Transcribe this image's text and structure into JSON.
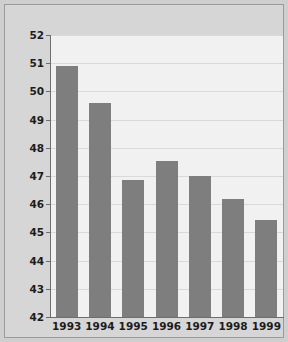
{
  "chart_data": {
    "type": "bar",
    "title": "",
    "xlabel": "",
    "ylabel": "% EU budget",
    "categories": [
      "1993",
      "1994",
      "1995",
      "1996",
      "1997",
      "1998",
      "1999"
    ],
    "values": [
      50.9,
      49.6,
      46.85,
      47.55,
      47.0,
      46.2,
      45.45
    ],
    "ylim": [
      42,
      52
    ],
    "yticks": [
      42,
      43,
      44,
      45,
      46,
      47,
      48,
      49,
      50,
      51,
      52
    ],
    "ytick_labels": [
      "42",
      "43",
      "44",
      "45",
      "46",
      "47",
      "48",
      "49",
      "50",
      "51",
      "52"
    ],
    "grid": true,
    "legend": false,
    "series": [
      {
        "name": "% EU budget",
        "values": [
          50.9,
          49.6,
          46.85,
          47.55,
          47.0,
          46.2,
          45.45
        ]
      }
    ],
    "colors": {
      "bar": "#7e7e7e",
      "plot_background": "#f1f1f1",
      "gridline": "#d9d9d9",
      "axis": "#6d6d6d",
      "page_background": "#d6d6d6",
      "text": "#1c1c1c"
    }
  }
}
